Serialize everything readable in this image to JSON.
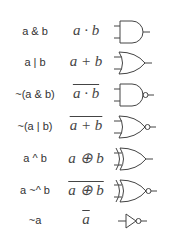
{
  "rows": [
    {
      "expr": "a & b",
      "math": "a · b",
      "overline": false,
      "gate": "and"
    },
    {
      "expr": "a | b",
      "math": "a + b",
      "overline": false,
      "gate": "or"
    },
    {
      "expr": "~(a & b)",
      "math": "a · b",
      "overline": true,
      "gate": "nand"
    },
    {
      "expr": "~(a | b)",
      "math": "a + b",
      "overline": true,
      "gate": "nor"
    },
    {
      "expr": "a ^ b",
      "math": "a ⊕ b",
      "overline": false,
      "gate": "xor"
    },
    {
      "expr": "a ~^ b",
      "math": "a ⊕ b",
      "overline": true,
      "gate": "xnor"
    },
    {
      "expr": "~a",
      "math": "a",
      "overline": true,
      "gate": "not"
    }
  ]
}
